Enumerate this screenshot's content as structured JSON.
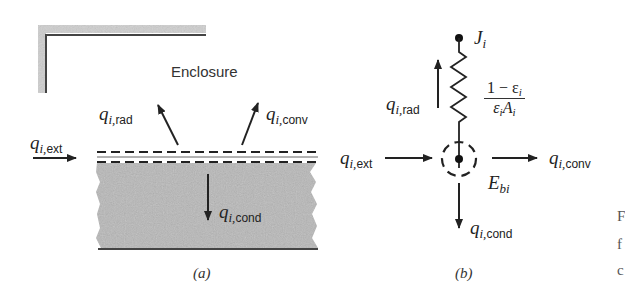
{
  "figure": {
    "panel_a": {
      "enclosure_label": "Enclosure",
      "caption": "(a)",
      "fluxes": {
        "ext": {
          "symbol": "q",
          "sub": "i,",
          "sub2": "ext",
          "direction": "right"
        },
        "rad": {
          "symbol": "q",
          "sub": "i,",
          "sub2": "rad",
          "direction": "up-left"
        },
        "conv": {
          "symbol": "q",
          "sub": "i,",
          "sub2": "conv",
          "direction": "up-right"
        },
        "cond": {
          "symbol": "q",
          "sub": "i,",
          "sub2": "cond",
          "direction": "down"
        }
      }
    },
    "panel_b": {
      "caption": "(b)",
      "radiosity_node": {
        "symbol": "J",
        "sub": "i"
      },
      "blackbody_node": {
        "symbol": "E",
        "sub": "bi"
      },
      "resistance": {
        "numerator": "1 − ε",
        "numerator_sub": "i",
        "denominator_a": "ε",
        "denominator_a_sub": "i",
        "denominator_b": "A",
        "denominator_b_sub": "i"
      },
      "fluxes": {
        "ext": {
          "symbol": "q",
          "sub": "i,",
          "sub2": "ext",
          "direction": "right"
        },
        "rad": {
          "symbol": "q",
          "sub": "i,",
          "sub2": "rad",
          "direction": "up"
        },
        "conv": {
          "symbol": "q",
          "sub": "i,",
          "sub2": "conv",
          "direction": "right"
        },
        "cond": {
          "symbol": "q",
          "sub": "i,",
          "sub2": "cond",
          "direction": "down"
        }
      }
    },
    "clipped_caption_fragments": [
      "F",
      "f",
      "c"
    ]
  },
  "colors": {
    "ink": "#222222",
    "slab_fill": "#b8b8b8",
    "enclosure_shadow": "#c8c8c8"
  }
}
